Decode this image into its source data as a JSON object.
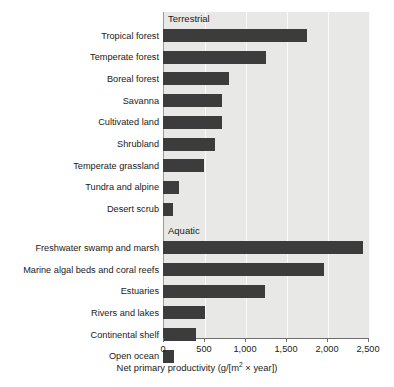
{
  "chart_data": {
    "type": "bar",
    "orientation": "horizontal",
    "title": "",
    "xlabel": "Net primary productivity (g/[m2 × year])",
    "xlabel_parts": {
      "before": "Net primary productivity (g/[m",
      "sup": "2",
      "after": " × year])"
    },
    "ylabel": "",
    "xlim": [
      0,
      2500
    ],
    "xticks": [
      0,
      500,
      1000,
      1500,
      2000,
      2500
    ],
    "xticklabels": [
      "0",
      "500",
      "1,000",
      "1,500",
      "2,000",
      "2,500"
    ],
    "grid": true,
    "grid_axis": "x",
    "legend": "none",
    "bar_color": "#3c3c3c",
    "plot_background": "#e8e8e6",
    "groups": [
      {
        "name": "Terrestrial",
        "categories": [
          "Tropical forest",
          "Temperate forest",
          "Boreal forest",
          "Savanna",
          "Cultivated land",
          "Shrubland",
          "Temperate grassland",
          "Tundra and alpine",
          "Desert scrub"
        ],
        "values": [
          1750,
          1250,
          800,
          720,
          715,
          635,
          500,
          195,
          120
        ]
      },
      {
        "name": "Aquatic",
        "categories": [
          "Freshwater swamp and marsh",
          "Marine algal beds and coral reefs",
          "Estuaries",
          "Rivers and lakes",
          "Continental shelf",
          "Open ocean"
        ],
        "values": [
          2445,
          1965,
          1245,
          510,
          405,
          130
        ]
      }
    ],
    "categories": [
      "Tropical forest",
      "Temperate forest",
      "Boreal forest",
      "Savanna",
      "Cultivated land",
      "Shrubland",
      "Temperate grassland",
      "Tundra and alpine",
      "Desert scrub",
      "Freshwater swamp and marsh",
      "Marine algal beds and coral reefs",
      "Estuaries",
      "Rivers and lakes",
      "Continental shelf",
      "Open ocean"
    ],
    "values": [
      1750,
      1250,
      800,
      720,
      715,
      635,
      500,
      195,
      120,
      2445,
      1965,
      1245,
      510,
      405,
      130
    ]
  }
}
